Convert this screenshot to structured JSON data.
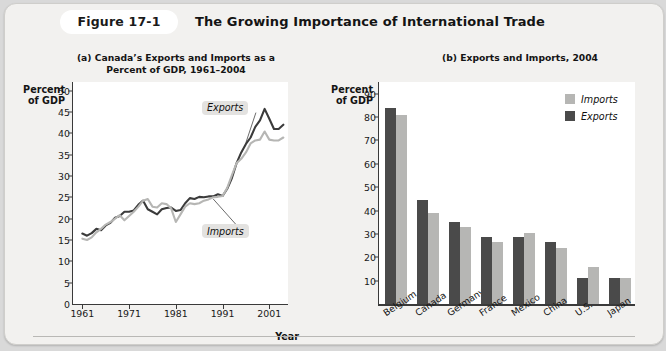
{
  "figure": {
    "badge_label": "Figure 17-1",
    "title": "The Growing Importance of International Trade"
  },
  "panel_a": {
    "subtitle": "(a) Canada’s Exports and Imports as a\nPercent of GDP, 1961–2004",
    "y_axis_title": "Percent\nof GDP",
    "x_axis_title": "Year",
    "callout_exports": "Exports",
    "callout_imports": "Imports"
  },
  "panel_b": {
    "subtitle": "(b) Exports and Imports, 2004",
    "y_axis_title": "Percent\nof GDP",
    "legend": [
      {
        "label": "Imports",
        "color": "#b6b6b4"
      },
      {
        "label": "Exports",
        "color": "#4a4a4a"
      }
    ]
  },
  "colors": {
    "exports_line": "#3b3b3b",
    "imports_line": "#b6b6b4",
    "card_bg": "#f2f1ef",
    "plot_bg": "#ffffff",
    "axis": "#3a3a3a"
  },
  "chart_data": [
    {
      "type": "line",
      "title": "(a) Canada’s Exports and Imports as a Percent of GDP, 1961–2004",
      "xlabel": "Year",
      "ylabel": "Percent of GDP",
      "xlim": [
        1959,
        2005
      ],
      "ylim": [
        0,
        52
      ],
      "yticks": [
        0,
        5,
        10,
        15,
        20,
        25,
        30,
        35,
        40,
        45,
        50
      ],
      "xticks": [
        1961,
        1971,
        1981,
        1991,
        2001
      ],
      "grid": false,
      "x": [
        1961,
        1962,
        1963,
        1964,
        1965,
        1966,
        1967,
        1968,
        1969,
        1970,
        1971,
        1972,
        1973,
        1974,
        1975,
        1976,
        1977,
        1978,
        1979,
        1980,
        1981,
        1982,
        1983,
        1984,
        1985,
        1986,
        1987,
        1988,
        1989,
        1990,
        1991,
        1992,
        1993,
        1994,
        1995,
        1996,
        1997,
        1998,
        1999,
        2000,
        2001,
        2002,
        2003,
        2004
      ],
      "series": [
        {
          "name": "Exports",
          "color": "#3b3b3b",
          "values": [
            16.5,
            16.0,
            16.6,
            17.6,
            17.3,
            18.4,
            19.0,
            20.2,
            20.6,
            21.6,
            21.6,
            21.9,
            23.3,
            24.2,
            22.2,
            21.6,
            21.0,
            22.2,
            22.5,
            22.6,
            21.8,
            22.0,
            23.6,
            24.8,
            24.6,
            25.1,
            25.0,
            25.2,
            25.2,
            25.7,
            25.3,
            27.0,
            29.5,
            33.0,
            35.5,
            37.5,
            39.0,
            41.5,
            43.0,
            45.7,
            43.4,
            41.0,
            41.0,
            42.0
          ]
        },
        {
          "name": "Imports",
          "color": "#b6b6b4",
          "values": [
            15.3,
            15.0,
            15.6,
            16.8,
            17.6,
            18.6,
            19.2,
            20.0,
            20.8,
            19.6,
            20.6,
            21.6,
            22.8,
            24.2,
            24.6,
            22.8,
            22.6,
            23.6,
            23.4,
            22.4,
            19.2,
            21.0,
            22.8,
            23.6,
            23.4,
            23.6,
            24.2,
            24.5,
            25.0,
            25.1,
            25.3,
            27.2,
            30.2,
            33.0,
            34.0,
            35.5,
            37.6,
            38.3,
            38.5,
            40.4,
            38.5,
            38.3,
            38.3,
            39.0
          ]
        }
      ],
      "annotations": [
        {
          "text": "Exports",
          "x": 1993,
          "y": 46
        },
        {
          "text": "Imports",
          "x": 1993,
          "y": 17
        }
      ]
    },
    {
      "type": "bar",
      "title": "(b) Exports and Imports, 2004",
      "ylabel": "Percent of GDP",
      "xlabel": "",
      "ylim": [
        0,
        95
      ],
      "yticks": [
        10,
        20,
        30,
        40,
        50,
        60,
        70,
        80,
        90
      ],
      "grid": false,
      "legend_position": "top-right",
      "categories": [
        "Belgium",
        "Canada",
        "Germany",
        "France",
        "Mexico",
        "China",
        "U.S.",
        "Japan"
      ],
      "series": [
        {
          "name": "Exports",
          "color": "#4a4a4a",
          "values": [
            84,
            44.5,
            35,
            28.5,
            28.5,
            26.5,
            11,
            11
          ]
        },
        {
          "name": "Imports",
          "color": "#b6b6b4",
          "values": [
            81,
            39,
            33,
            26.5,
            30.5,
            24,
            16,
            11
          ]
        }
      ]
    }
  ]
}
